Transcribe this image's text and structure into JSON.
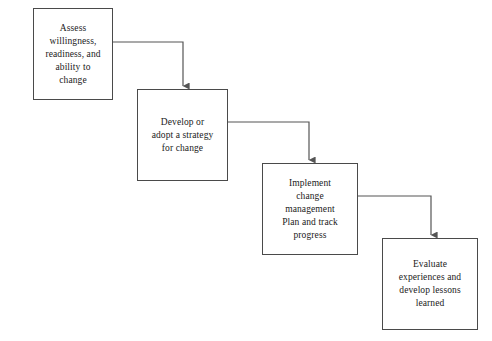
{
  "diagram": {
    "type": "flowchart",
    "orientation": "left-to-right descending staircase",
    "background_color": "#ffffff",
    "box_border_color": "#4a4a4a",
    "connector_color": "#555555",
    "text_color": "#1a1a1a",
    "nodes": [
      {
        "id": "assess",
        "label": "Assess\nwillingness,\nreadiness, and\nability to\nchange",
        "x": 33,
        "y": 8,
        "width": 80,
        "height": 92
      },
      {
        "id": "develop",
        "label": "Develop or\nadopt a strategy\nfor change",
        "x": 137,
        "y": 89,
        "width": 91,
        "height": 92
      },
      {
        "id": "implement",
        "label": "Implement\nchange\nmanagement\nPlan and track\nprogress",
        "x": 262,
        "y": 163,
        "width": 96,
        "height": 92
      },
      {
        "id": "evaluate",
        "label": "Evaluate\nexperiences and\ndevelop lessons\nlearned",
        "x": 382,
        "y": 238,
        "width": 96,
        "height": 92
      }
    ],
    "connectors": [
      {
        "id": "assess-to-develop",
        "from": "assess",
        "to": "develop",
        "from_x": 113,
        "from_y": 42,
        "elbow_x": 183,
        "to_x": 183,
        "to_y": 89,
        "arrowhead": "down"
      },
      {
        "id": "develop-to-implement",
        "from": "develop",
        "to": "implement",
        "from_x": 228,
        "from_y": 122,
        "elbow_x": 309,
        "to_x": 309,
        "to_y": 163,
        "arrowhead": "down"
      },
      {
        "id": "implement-to-evaluate",
        "from": "implement",
        "to": "evaluate",
        "from_x": 358,
        "from_y": 196,
        "elbow_x": 431,
        "to_x": 431,
        "to_y": 238,
        "arrowhead": "down"
      }
    ]
  }
}
